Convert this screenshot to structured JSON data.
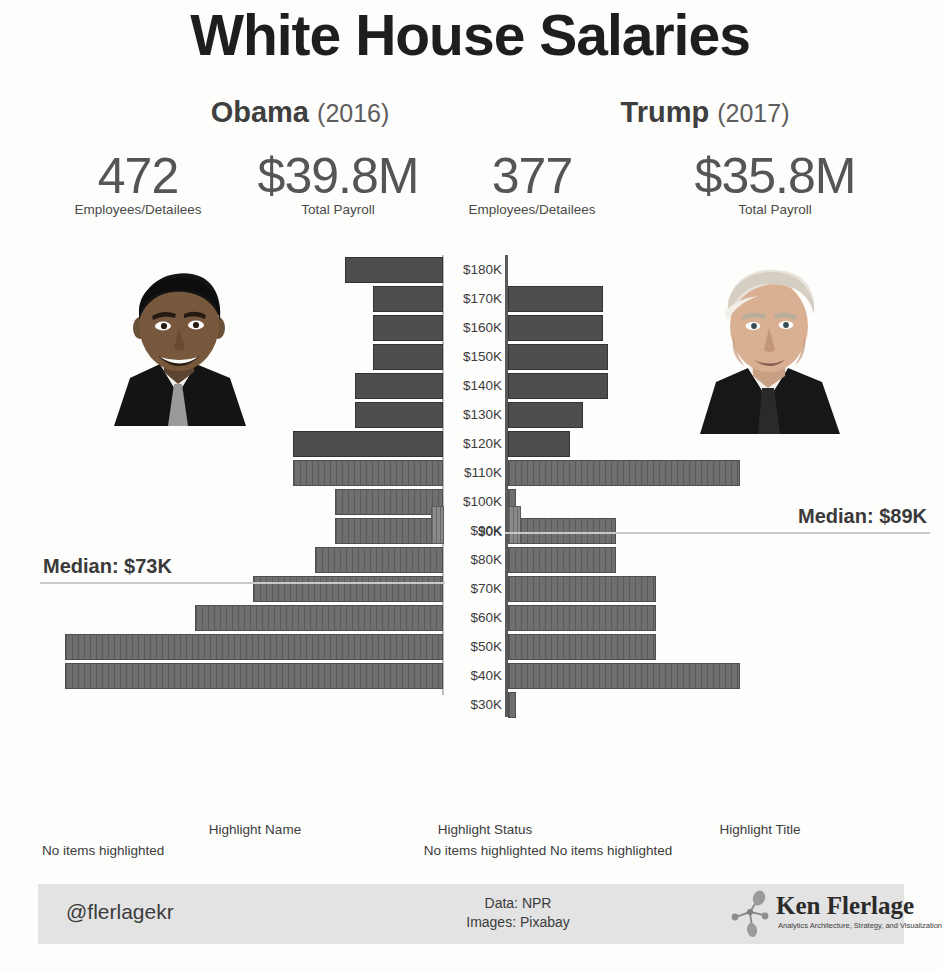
{
  "title": "White House Salaries",
  "administrations": [
    {
      "name": "Obama",
      "year": "(2016)",
      "employees": "472",
      "employees_caption": "Employees/Detailees",
      "payroll": "$39.8M",
      "payroll_caption": "Total Payroll",
      "median_label": "Median: $73K",
      "portrait": "obama-portrait"
    },
    {
      "name": "Trump",
      "year": "(2017)",
      "employees": "377",
      "employees_caption": "Employees/Detailees",
      "payroll": "$35.8M",
      "payroll_caption": "Total Payroll",
      "median_label": "Median: $89K",
      "portrait": "trump-portrait"
    }
  ],
  "zero_tick": "$0K",
  "highlight_controls": [
    {
      "title": "Highlight Name",
      "value": "No items highlighted"
    },
    {
      "title": "Highlight Status",
      "value": "No items highlighted"
    },
    {
      "title": "Highlight Title",
      "value": "No items highlighted"
    }
  ],
  "footer": {
    "handle": "@flerlagekr",
    "credits": "Data: NPR\nImages: Pixabay",
    "credit_line_1": "Data: NPR",
    "credit_line_2": "Images: Pixabay",
    "brand": "Ken Flerlage",
    "tagline": "Analytics Architecture, Strategy, and Visualization"
  },
  "colors": {
    "bar": "#6f6f6f",
    "bar_dark": "#4e4e4e",
    "median_line": "#c9c9c9",
    "text": "#3c3c3c",
    "footer_bg": "#e3e3e3"
  },
  "chart_data": {
    "type": "bar",
    "subtype": "diverging-population-pyramid",
    "title": "White House Salaries",
    "xlabel": "",
    "ylabel": "Salary Band",
    "orientation": "horizontal",
    "grid": false,
    "legend": "none",
    "note": "Left bars = Obama 2016, right bars = Trump 2017. Values are counts of employees per $10K salary band, estimated from bar lengths.",
    "categories": [
      "$180K",
      "$170K",
      "$160K",
      "$150K",
      "$140K",
      "$130K",
      "$120K",
      "$110K",
      "$100K",
      "$90K",
      "$80K",
      "$70K",
      "$60K",
      "$50K",
      "$40K",
      "$30K",
      "$0K"
    ],
    "series": [
      {
        "name": "Obama (2016)",
        "side": "left",
        "bar_pixel_widths": [
          98,
          70,
          70,
          70,
          88,
          88,
          150,
          150,
          108,
          108,
          128,
          190,
          248,
          378,
          378,
          0,
          13
        ],
        "values": [
          25,
          18,
          18,
          18,
          22,
          22,
          38,
          38,
          27,
          27,
          32,
          48,
          63,
          96,
          96,
          0,
          3
        ]
      },
      {
        "name": "Trump (2017)",
        "side": "right",
        "bar_pixel_widths": [
          0,
          95,
          95,
          100,
          100,
          75,
          62,
          232,
          8,
          108,
          108,
          148,
          148,
          148,
          232,
          8,
          13
        ],
        "values": [
          0,
          24,
          24,
          25,
          25,
          19,
          16,
          59,
          2,
          27,
          27,
          38,
          38,
          38,
          59,
          2,
          3
        ]
      }
    ],
    "annotations": [
      {
        "text": "Median: $73K",
        "series": "Obama (2016)",
        "value": 73000
      },
      {
        "text": "Median: $89K",
        "series": "Trump (2017)",
        "value": 89000
      }
    ]
  }
}
